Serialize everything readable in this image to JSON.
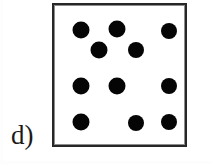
{
  "figure": {
    "panel_label": "d)",
    "width": 211,
    "height": 164,
    "background_color": "#ffffff"
  },
  "box": {
    "name": "dot-pattern-box",
    "x": 52,
    "y": 3,
    "width": 135,
    "height": 144,
    "border_color": "#272727",
    "border_width": 2,
    "fill_color": "#ffffff"
  },
  "dots": {
    "count": 11,
    "color": "#050505",
    "diameter": 16,
    "shape": "circle",
    "items": [
      {
        "id": 1,
        "row": 1,
        "cx": 79,
        "cy": 28,
        "d": 17
      },
      {
        "id": 2,
        "row": 1,
        "cx": 115,
        "cy": 27,
        "d": 17
      },
      {
        "id": 3,
        "row": 1,
        "cx": 167,
        "cy": 29,
        "d": 16
      },
      {
        "id": 4,
        "row": 2,
        "cx": 97,
        "cy": 48,
        "d": 17
      },
      {
        "id": 5,
        "row": 2,
        "cx": 134,
        "cy": 48,
        "d": 16
      },
      {
        "id": 6,
        "row": 3,
        "cx": 79,
        "cy": 84,
        "d": 17
      },
      {
        "id": 7,
        "row": 3,
        "cx": 115,
        "cy": 84,
        "d": 17
      },
      {
        "id": 8,
        "row": 3,
        "cx": 167,
        "cy": 84,
        "d": 16
      },
      {
        "id": 9,
        "row": 4,
        "cx": 79,
        "cy": 120,
        "d": 17
      },
      {
        "id": 10,
        "row": 4,
        "cx": 134,
        "cy": 121,
        "d": 16
      },
      {
        "id": 11,
        "row": 4,
        "cx": 167,
        "cy": 120,
        "d": 16
      }
    ]
  }
}
